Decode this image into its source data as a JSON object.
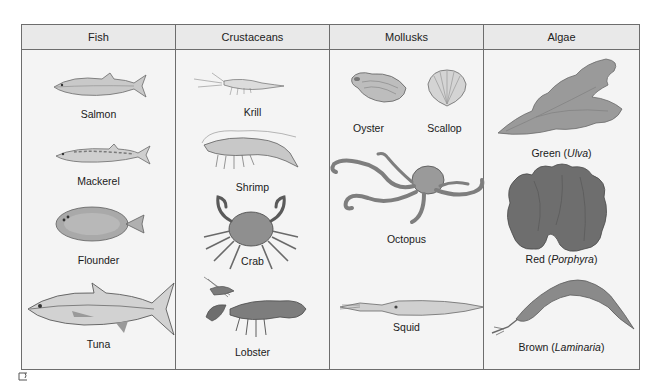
{
  "figure": {
    "columns": [
      {
        "header": "Fish",
        "items": [
          {
            "label": "Salmon",
            "icon": "salmon-icon"
          },
          {
            "label": "Mackerel",
            "icon": "mackerel-icon"
          },
          {
            "label": "Flounder",
            "icon": "flounder-icon"
          },
          {
            "label": "Tuna",
            "icon": "tuna-icon"
          }
        ]
      },
      {
        "header": "Crustaceans",
        "items": [
          {
            "label": "Krill",
            "icon": "krill-icon"
          },
          {
            "label": "Shrimp",
            "icon": "shrimp-icon"
          },
          {
            "label": "Crab",
            "icon": "crab-icon"
          },
          {
            "label": "Lobster",
            "icon": "lobster-icon"
          }
        ]
      },
      {
        "header": "Mollusks",
        "items": [
          {
            "label": "Oyster",
            "icon": "oyster-icon"
          },
          {
            "label": "Scallop",
            "icon": "scallop-icon"
          },
          {
            "label": "Octopus",
            "icon": "octopus-icon"
          },
          {
            "label": "Squid",
            "icon": "squid-icon"
          }
        ]
      },
      {
        "header": "Algae",
        "items": [
          {
            "label_prefix": "Green (",
            "label_italic": "Ulva",
            "label_suffix": ")",
            "icon": "green-algae-icon"
          },
          {
            "label_prefix": "Red (",
            "label_italic": "Porphyra",
            "label_suffix": ")",
            "icon": "red-algae-icon"
          },
          {
            "label_prefix": "Brown (",
            "label_italic": "Laminaria",
            "label_suffix": ")",
            "icon": "brown-algae-icon"
          }
        ]
      }
    ],
    "colors": {
      "border": "#6d6d6d",
      "header_bg": "#e9e9e9",
      "cell_bg": "#f4f4f4",
      "drawing": "#8a8a8a",
      "drawing_dark": "#5a5a5a"
    }
  }
}
